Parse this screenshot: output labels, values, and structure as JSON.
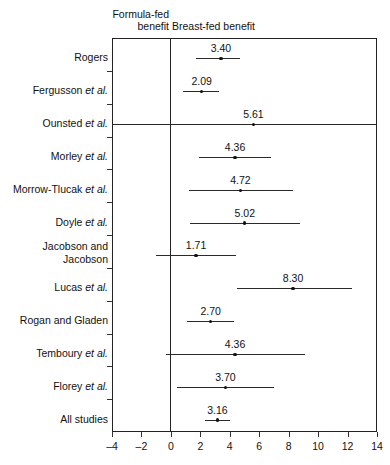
{
  "header": {
    "left_label": "Formula-fed\nbenefit",
    "right_label": "Breast-fed benefit"
  },
  "axis": {
    "tick_labels": [
      "-4",
      "-2",
      "0",
      "2",
      "4",
      "6",
      "8",
      "10",
      "12",
      "14"
    ],
    "tick_values": [
      -4,
      -2,
      0,
      2,
      4,
      6,
      8,
      10,
      12,
      14
    ],
    "xmin": -4,
    "xmax": 14,
    "null_value": 0
  },
  "chart_data": {
    "type": "scatter",
    "title": "",
    "xlabel": "",
    "ylabel": "",
    "xlim": [
      -4,
      14
    ],
    "grid": false,
    "legend": "none",
    "annotations": [
      "Formula-fed benefit",
      "Breast-fed benefit"
    ],
    "categories": [
      "Rogers",
      "Fergusson et al.",
      "Ounsted et al.",
      "Morley et al.",
      "Morrow-Tlucak et al.",
      "Doyle et al.",
      "Jacobson and Jacobson",
      "Lucas et al.",
      "Rogan and Gladen",
      "Temboury et al.",
      "Florey et al.",
      "All studies"
    ],
    "values": [
      3.4,
      2.09,
      5.61,
      4.36,
      4.72,
      5.02,
      1.71,
      8.3,
      2.7,
      4.36,
      3.7,
      3.16
    ],
    "ci_low": [
      1.7,
      0.8,
      -4.0,
      1.9,
      1.25,
      1.3,
      -1.0,
      4.5,
      1.1,
      -0.3,
      0.4,
      2.3
    ],
    "ci_high": [
      4.7,
      3.3,
      14.0,
      6.8,
      8.3,
      8.8,
      4.4,
      12.3,
      4.3,
      9.1,
      7.0,
      4.0
    ]
  },
  "rows": [
    {
      "label": "Rogers",
      "italic": "",
      "value": "3.40",
      "point": 3.4,
      "low": 1.7,
      "high": 4.7,
      "clip_left": false,
      "clip_right": false,
      "two_line": false
    },
    {
      "label": "Fergusson",
      "italic": "et al.",
      "value": "2.09",
      "point": 2.09,
      "low": 0.8,
      "high": 3.3,
      "clip_left": false,
      "clip_right": false,
      "two_line": false
    },
    {
      "label": "Ounsted",
      "italic": "et al.",
      "value": "5.61",
      "point": 5.61,
      "low": -4.0,
      "high": 14.0,
      "clip_left": true,
      "clip_right": true,
      "two_line": false
    },
    {
      "label": "Morley",
      "italic": "et al.",
      "value": "4.36",
      "point": 4.36,
      "low": 1.9,
      "high": 6.8,
      "clip_left": false,
      "clip_right": false,
      "two_line": false
    },
    {
      "label": "Morrow-Tlucak",
      "italic": "et al.",
      "value": "4.72",
      "point": 4.72,
      "low": 1.25,
      "high": 8.3,
      "clip_left": false,
      "clip_right": false,
      "two_line": false
    },
    {
      "label": "Doyle",
      "italic": "et al.",
      "value": "5.02",
      "point": 5.02,
      "low": 1.3,
      "high": 8.8,
      "clip_left": false,
      "clip_right": false,
      "two_line": false
    },
    {
      "label": "Jacobson and",
      "italic": "",
      "label2": "Jacobson",
      "value": "1.71",
      "point": 1.71,
      "low": -1.0,
      "high": 4.4,
      "clip_left": false,
      "clip_right": false,
      "two_line": true
    },
    {
      "label": "Lucas",
      "italic": "et al.",
      "value": "8.30",
      "point": 8.3,
      "low": 4.5,
      "high": 12.3,
      "clip_left": false,
      "clip_right": false,
      "two_line": false
    },
    {
      "label": "Rogan and Gladen",
      "italic": "",
      "value": "2.70",
      "point": 2.7,
      "low": 1.1,
      "high": 4.3,
      "clip_left": false,
      "clip_right": false,
      "two_line": false
    },
    {
      "label": "Temboury",
      "italic": "et al.",
      "value": "4.36",
      "point": 4.36,
      "low": -0.3,
      "high": 9.1,
      "clip_left": false,
      "clip_right": false,
      "two_line": false
    },
    {
      "label": "Florey",
      "italic": "et al.",
      "value": "3.70",
      "point": 3.7,
      "low": 0.4,
      "high": 7.0,
      "clip_left": false,
      "clip_right": false,
      "two_line": false
    },
    {
      "label": "All studies",
      "italic": "",
      "value": "3.16",
      "point": 3.16,
      "low": 2.3,
      "high": 4.0,
      "clip_left": false,
      "clip_right": false,
      "two_line": false
    }
  ]
}
